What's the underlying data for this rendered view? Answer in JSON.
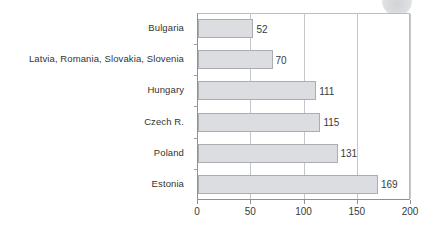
{
  "chart_data": {
    "type": "bar",
    "orientation": "horizontal",
    "title": "",
    "subtitle": "",
    "xlabel": "",
    "ylabel": "",
    "categories": [
      "Bulgaria",
      "Latvia, Romania, Slovakia, Slovenia",
      "Hungary",
      "Czech R.",
      "Poland",
      "Estonia"
    ],
    "values": [
      52,
      70,
      111,
      115,
      131,
      169
    ],
    "value_labels": [
      "52",
      "70",
      "111",
      "115",
      "131",
      "169"
    ],
    "xlim": [
      0,
      200
    ],
    "xticks": [
      0,
      50,
      100,
      150,
      200
    ],
    "xtick_labels": [
      "0",
      "50",
      "100",
      "150",
      "200"
    ],
    "grid": "vertical",
    "legend": "none",
    "series": [
      {
        "name": "",
        "values": [
          52,
          70,
          111,
          115,
          131,
          169
        ]
      }
    ]
  },
  "style": {
    "bar_fill": "#dcdde1",
    "bar_border": "#a9acb1",
    "axis_color": "#8d9095",
    "grid_color": "#c3c6ca",
    "text_color": "#3a3a3a",
    "background": "#ffffff"
  },
  "artifact": {
    "name": "scan-artifact-circle"
  }
}
